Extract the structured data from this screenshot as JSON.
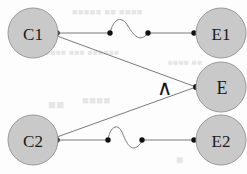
{
  "figure": {
    "width": 247,
    "height": 174,
    "background_color": "#fdfdfd"
  },
  "style": {
    "node_fill": "#c9c9c9",
    "node_stroke": "#9a9a9a",
    "node_radius": 25,
    "edge_color": "#6b6b6b",
    "dot_color": "#111111",
    "dot_radius": 2.6,
    "label_color": "#1a1a1a",
    "bleed_color": "#e2e2e2"
  },
  "nodes": [
    {
      "id": "C1",
      "label": "C1",
      "cx": 33,
      "cy": 33,
      "r": 25
    },
    {
      "id": "E1",
      "label": "E1",
      "cx": 221,
      "cy": 33,
      "r": 25
    },
    {
      "id": "E",
      "label": "E",
      "cx": 221,
      "cy": 87,
      "r": 25
    },
    {
      "id": "C2",
      "label": "C2",
      "cx": 33,
      "cy": 140,
      "r": 25
    },
    {
      "id": "E2",
      "label": "E2",
      "cx": 221,
      "cy": 140,
      "r": 25
    }
  ],
  "edges": [
    {
      "id": "C1-E1",
      "from": "C1",
      "to": "E1",
      "kind": "horizontal-squiggle",
      "y": 33,
      "x1": 57,
      "x2": 195,
      "squiggle": "s-curve-up-first"
    },
    {
      "id": "C2-E2",
      "from": "C2",
      "to": "E2",
      "kind": "horizontal-squiggle",
      "y": 140,
      "x1": 57,
      "x2": 195,
      "squiggle": "s-curve-up-first"
    },
    {
      "id": "C1-E",
      "from": "C1",
      "to": "E",
      "kind": "diagonal",
      "x1": 57,
      "y1": 36,
      "x2": 196,
      "y2": 87
    },
    {
      "id": "C2-E",
      "from": "C2",
      "to": "E",
      "kind": "diagonal",
      "x1": 57,
      "y1": 137,
      "x2": 196,
      "y2": 87
    }
  ],
  "edge_dots": [
    {
      "edge": "C1-E1",
      "cx": 57,
      "cy": 33
    },
    {
      "edge": "C1-E1",
      "cx": 110,
      "cy": 33
    },
    {
      "edge": "C1-E1",
      "cx": 148,
      "cy": 33
    },
    {
      "edge": "C1-E1",
      "cx": 194,
      "cy": 33
    },
    {
      "edge": "C2-E2",
      "cx": 57,
      "cy": 140
    },
    {
      "edge": "C2-E2",
      "cx": 108,
      "cy": 140
    },
    {
      "edge": "C2-E2",
      "cx": 142,
      "cy": 140
    },
    {
      "edge": "C2-E2",
      "cx": 194,
      "cy": 140
    },
    {
      "edge": "C1-E/C2-E",
      "cx": 196,
      "cy": 87
    }
  ],
  "annotations": [
    {
      "id": "and-wedge",
      "symbol": "∧",
      "x": 164,
      "y": 88,
      "meaning": "logical-and"
    }
  ],
  "background_bleed": [
    {
      "id": "bleed-top-1",
      "text": "■■■■■ ■■ ■■■■",
      "x": 72,
      "y": 12,
      "size": 9
    },
    {
      "id": "bleed-mid-1",
      "text": "■■■■■ ■■■ ■■■■■■",
      "x": 40,
      "y": 52,
      "size": 8
    },
    {
      "id": "bleed-mid-2",
      "text": "■■■■ ■■",
      "x": 168,
      "y": 62,
      "size": 8
    },
    {
      "id": "bleed-low-1",
      "text": "■■",
      "x": 48,
      "y": 104,
      "size": 13
    },
    {
      "id": "bleed-low-2",
      "text": "■■■■",
      "x": 82,
      "y": 100,
      "size": 11
    },
    {
      "id": "bleed-bottom-1",
      "text": "■",
      "x": 176,
      "y": 160,
      "size": 12
    },
    {
      "id": "bleed-right-1",
      "text": "■■",
      "x": 212,
      "y": 120,
      "size": 9
    }
  ]
}
